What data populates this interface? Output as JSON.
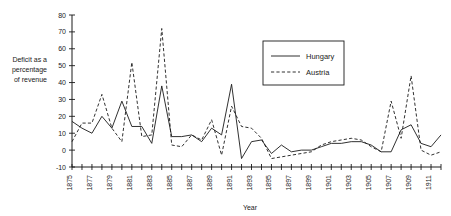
{
  "chart_data": {
    "type": "line",
    "title": "",
    "xlabel": "Year",
    "ylabel": "Deficit as a percentage of revenue",
    "ylabel_lines": [
      "Deficit as a",
      "percentage",
      "of revenue"
    ],
    "ylim": [
      -10,
      80
    ],
    "xlim": [
      1875,
      1912
    ],
    "yticks": [
      -10,
      0,
      10,
      20,
      30,
      40,
      50,
      60,
      70,
      80
    ],
    "ytick_labels": [
      "-10",
      "0",
      "10",
      "20",
      "30",
      "40",
      "50",
      "60",
      "70",
      "80"
    ],
    "grid": false,
    "legend_position": "upper-right-inset",
    "x": [
      1875,
      1876,
      1877,
      1878,
      1879,
      1880,
      1881,
      1882,
      1883,
      1884,
      1885,
      1886,
      1887,
      1888,
      1889,
      1890,
      1891,
      1892,
      1893,
      1894,
      1895,
      1896,
      1897,
      1898,
      1899,
      1900,
      1901,
      1902,
      1903,
      1904,
      1905,
      1906,
      1907,
      1908,
      1909,
      1910,
      1911,
      1912
    ],
    "xtick_labels": [
      "1875",
      "",
      "1877",
      "",
      "1879",
      "",
      "1881",
      "",
      "1883",
      "",
      "1885",
      "",
      "1887",
      "",
      "1889",
      "",
      "1891",
      "",
      "1893",
      "",
      "1895",
      "",
      "1897",
      "",
      "1899",
      "",
      "1901",
      "",
      "1903",
      "",
      "1905",
      "",
      "1907",
      "",
      "1909",
      "",
      "1911",
      ""
    ],
    "series": [
      {
        "name": "Hungary",
        "style": "solid",
        "values": [
          17,
          13,
          10,
          20,
          13,
          29,
          14,
          14,
          4,
          38,
          8,
          8,
          9,
          5,
          13,
          9,
          39,
          -5,
          5,
          6,
          -2,
          3,
          -1,
          0,
          0,
          2,
          4,
          4,
          5,
          5,
          3,
          -1,
          -1,
          12,
          15,
          4,
          2,
          9
        ]
      },
      {
        "name": "Austria",
        "style": "dashed",
        "values": [
          5,
          16,
          16,
          33,
          13,
          5,
          52,
          8,
          9,
          72,
          3,
          2,
          9,
          6,
          18,
          -3,
          26,
          14,
          13,
          7,
          -5,
          -4,
          -3,
          -2,
          -1,
          3,
          5,
          6,
          7,
          6,
          2,
          -1,
          29,
          7,
          44,
          0,
          -3,
          -1
        ]
      }
    ],
    "legend": [
      {
        "label": "Hungary",
        "style": "solid"
      },
      {
        "label": "Austria",
        "style": "dashed"
      }
    ]
  }
}
